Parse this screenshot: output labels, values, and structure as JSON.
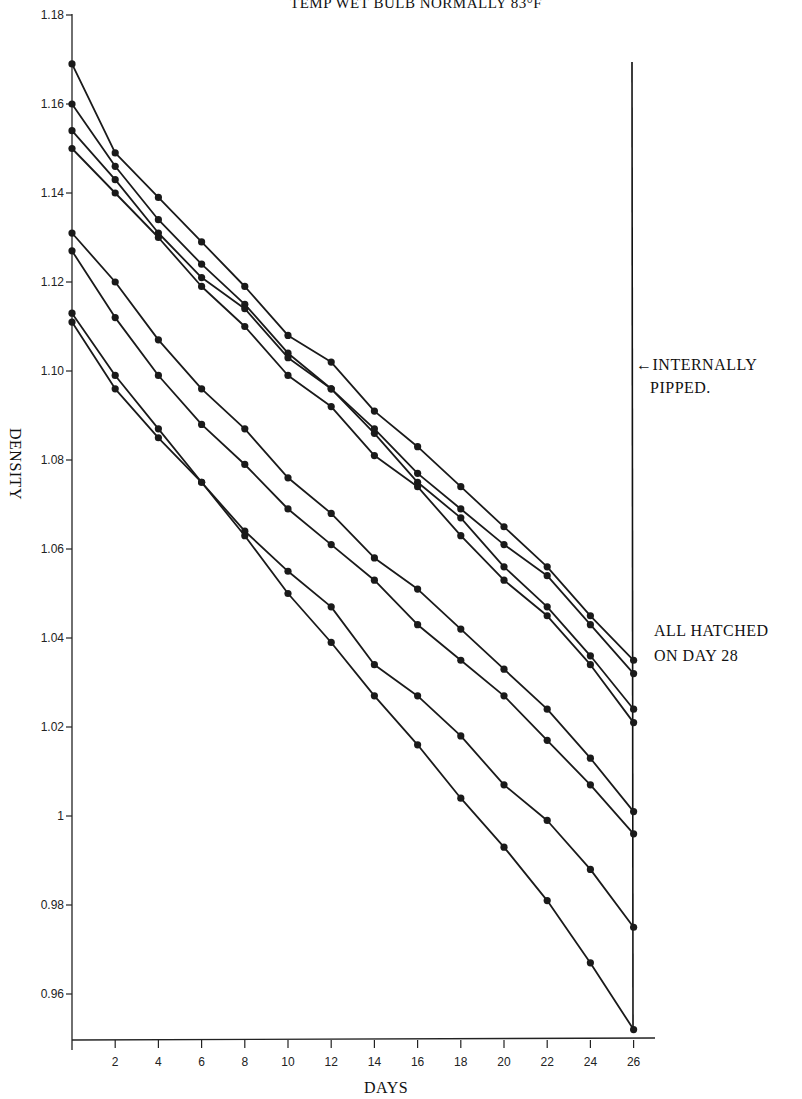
{
  "chart_data": {
    "type": "line",
    "title": "TEMP WET BULB NORMALLY 83°F",
    "xlabel": "DAYS",
    "ylabel": "DENSITY",
    "x": [
      0,
      2,
      4,
      6,
      8,
      10,
      12,
      14,
      16,
      18,
      20,
      22,
      24,
      26
    ],
    "xticks": [
      "2",
      "4",
      "6",
      "8",
      "10",
      "12",
      "14",
      "16",
      "18",
      "20",
      "22",
      "24",
      "26"
    ],
    "yticks": [
      "0.96",
      "0.98",
      "1",
      "1.02",
      "1.04",
      "1.06",
      "1.08",
      "1.10",
      "1.12",
      "1.14",
      "1.16",
      "1.18"
    ],
    "ylim": [
      0.95,
      1.18
    ],
    "xlim": [
      0,
      27
    ],
    "grid": false,
    "legend": null,
    "series": [
      {
        "name": "Egg 1",
        "values": [
          1.169,
          1.149,
          1.139,
          1.129,
          1.119,
          1.108,
          1.102,
          1.091,
          1.083,
          1.074,
          1.065,
          1.056,
          1.045,
          1.035
        ]
      },
      {
        "name": "Egg 2",
        "values": [
          1.16,
          1.146,
          1.134,
          1.124,
          1.115,
          1.104,
          1.096,
          1.087,
          1.077,
          1.069,
          1.061,
          1.054,
          1.043,
          1.032
        ]
      },
      {
        "name": "Egg 3",
        "values": [
          1.154,
          1.143,
          1.131,
          1.121,
          1.114,
          1.103,
          1.096,
          1.086,
          1.075,
          1.067,
          1.056,
          1.047,
          1.036,
          1.024
        ]
      },
      {
        "name": "Egg 4",
        "values": [
          1.15,
          1.14,
          1.13,
          1.119,
          1.11,
          1.099,
          1.092,
          1.081,
          1.074,
          1.063,
          1.053,
          1.045,
          1.034,
          1.021
        ]
      },
      {
        "name": "Egg 5",
        "values": [
          1.131,
          1.12,
          1.107,
          1.096,
          1.087,
          1.076,
          1.068,
          1.058,
          1.051,
          1.042,
          1.033,
          1.024,
          1.013,
          1.001
        ]
      },
      {
        "name": "Egg 6",
        "values": [
          1.127,
          1.112,
          1.099,
          1.088,
          1.079,
          1.069,
          1.061,
          1.053,
          1.043,
          1.035,
          1.027,
          1.017,
          1.007,
          0.996
        ]
      },
      {
        "name": "Egg 7",
        "values": [
          1.113,
          1.099,
          1.087,
          1.075,
          1.064,
          1.055,
          1.047,
          1.034,
          1.027,
          1.018,
          1.007,
          0.999,
          0.988,
          0.975
        ]
      },
      {
        "name": "Egg 8",
        "values": [
          1.111,
          1.096,
          1.085,
          1.075,
          1.063,
          1.05,
          1.039,
          1.027,
          1.016,
          1.004,
          0.993,
          0.981,
          0.967,
          0.952
        ]
      }
    ],
    "annotations": [
      {
        "text": "←INTERNALLY PIPPED.",
        "x": 26,
        "y": 1.1
      },
      {
        "text": "ALL HATCHED ON DAY 28",
        "x": 27,
        "y": 1.04
      }
    ],
    "vertical_marker": {
      "x": 26
    }
  },
  "labels": {
    "title": "TEMP WET BULB NORMALLY 83°F",
    "xlabel": "DAYS",
    "ylabel": "DENSITY",
    "pipped_line1": "←INTERNALLY",
    "pipped_line2": "PIPPED.",
    "hatched_line1": "ALL HATCHED",
    "hatched_line2": "ON DAY 28"
  },
  "style": {
    "line_color": "#1a1a1a",
    "background": "#ffffff"
  }
}
